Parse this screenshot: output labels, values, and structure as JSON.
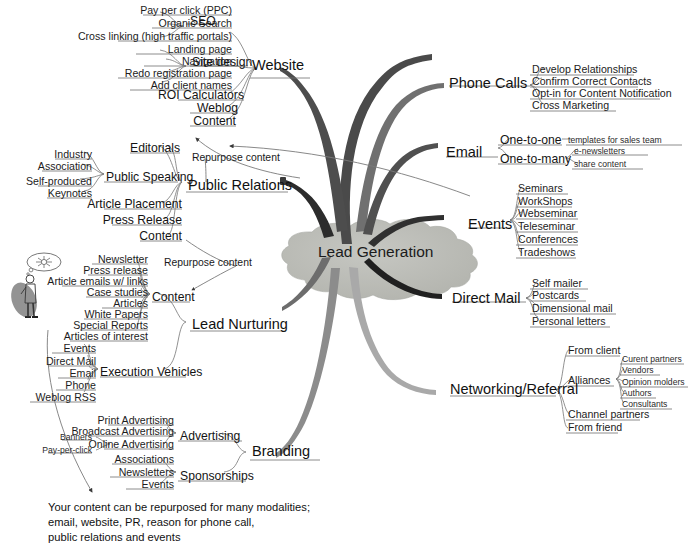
{
  "title": "Lead Generation",
  "center": {
    "label": "Lead Generation",
    "fill": "#b9bab5"
  },
  "colors": {
    "website": "#4a4a4a",
    "public_relations": "#2b2b2b",
    "lead_nurturing": "#6b6b6b",
    "branding": "#8a8a8a",
    "phone_calls": "#6f6f6f",
    "email": "#4e4e4e",
    "events": "#2f2f2f",
    "direct_mail": "#1f1f1f",
    "networking": "#a8a8a8",
    "hairline": "#8d8d8d"
  },
  "branches": [
    {
      "id": "website",
      "label": "Website",
      "side": "left",
      "children": [
        {
          "label": "SEO",
          "children": [
            {
              "label": "Pay per click (PPC)"
            },
            {
              "label": "Organic Search"
            },
            {
              "label": "Cross linking (high traffic portals)"
            }
          ]
        },
        {
          "label": "Site design",
          "children": [
            {
              "label": "Landing page"
            },
            {
              "label": "Navigation"
            },
            {
              "label": "Redo registration page"
            },
            {
              "label": "Add client names"
            }
          ]
        },
        {
          "label": "ROI Calculators"
        },
        {
          "label": "Weblog"
        },
        {
          "label": "Content"
        }
      ]
    },
    {
      "id": "public_relations",
      "label": "Public Relations",
      "side": "left",
      "children": [
        {
          "label": "Public Speaking",
          "children": [
            {
              "label": "Industry"
            },
            {
              "label": "Association"
            },
            {
              "label": "Self-produced"
            },
            {
              "label": "Keynotes"
            }
          ]
        },
        {
          "label": "Editorials"
        },
        {
          "label": "Article Placement"
        },
        {
          "label": "Press Release"
        },
        {
          "label": "Content"
        }
      ]
    },
    {
      "id": "lead_nurturing",
      "label": "Lead Nurturing",
      "side": "left",
      "children": [
        {
          "label": "Content",
          "children": [
            {
              "label": "Newsletter"
            },
            {
              "label": "Press release"
            },
            {
              "label": "Article emails w/ links"
            },
            {
              "label": "Case studies"
            },
            {
              "label": "Articles"
            },
            {
              "label": "White Papers"
            },
            {
              "label": "Special Reports"
            },
            {
              "label": "Articles of interest"
            }
          ]
        },
        {
          "label": "Execution Vehicles",
          "children": [
            {
              "label": "Events"
            },
            {
              "label": "Direct Mail"
            },
            {
              "label": "Email"
            },
            {
              "label": "Phone"
            },
            {
              "label": "Weblog RSS"
            }
          ]
        }
      ]
    },
    {
      "id": "branding",
      "label": "Branding",
      "side": "left",
      "children": [
        {
          "label": "Advertising",
          "children": [
            {
              "label": "Print Advertising"
            },
            {
              "label": "Broadcast Advertising"
            },
            {
              "label": "Online Advertising",
              "children": [
                {
                  "label": "Banners"
                },
                {
                  "label": "Pay-per-click"
                }
              ]
            }
          ]
        },
        {
          "label": "Sponsorships",
          "children": [
            {
              "label": "Associations"
            },
            {
              "label": "Newsletters"
            },
            {
              "label": "Events"
            }
          ]
        }
      ]
    },
    {
      "id": "phone_calls",
      "label": "Phone Calls",
      "side": "right",
      "children": [
        {
          "label": "Develop Relationships"
        },
        {
          "label": "Confirm Correct Contacts"
        },
        {
          "label": "Opt-in for Content Notification"
        },
        {
          "label": "Cross Marketing"
        }
      ]
    },
    {
      "id": "email",
      "label": "Email",
      "side": "right",
      "children": [
        {
          "label": "One-to-one",
          "children": [
            {
              "label": "templates for sales team"
            }
          ]
        },
        {
          "label": "One-to-many",
          "children": [
            {
              "label": "e-newsletters"
            },
            {
              "label": "share content"
            }
          ]
        }
      ]
    },
    {
      "id": "events",
      "label": "Events",
      "side": "right",
      "children": [
        {
          "label": "Seminars"
        },
        {
          "label": "WorkShops"
        },
        {
          "label": "Webseminar"
        },
        {
          "label": "Teleseminar"
        },
        {
          "label": "Conferences"
        },
        {
          "label": "Tradeshows"
        }
      ]
    },
    {
      "id": "direct_mail",
      "label": "Direct Mail",
      "side": "right",
      "children": [
        {
          "label": "Self mailer"
        },
        {
          "label": "Postcards"
        },
        {
          "label": "Dimensional mail"
        },
        {
          "label": "Personal letters"
        }
      ]
    },
    {
      "id": "networking",
      "label": "Networking/Referral",
      "side": "right",
      "children": [
        {
          "label": "From client"
        },
        {
          "label": "Alliances",
          "children": [
            {
              "label": "Curent partners"
            },
            {
              "label": "Vendors"
            },
            {
              "label": "Opinion molders"
            },
            {
              "label": "Authors"
            },
            {
              "label": "Consultants"
            }
          ]
        },
        {
          "label": "Channel partners"
        },
        {
          "label": "From friend"
        }
      ]
    }
  ],
  "annotations": {
    "repurpose_top": "Repurpose content",
    "repurpose_mid": "Repurpose content",
    "footnote_line1": "Your content can be repurposed for many modalities;",
    "footnote_line2": "email, website, PR, reason for phone call,",
    "footnote_line3": "public relations and events"
  },
  "labels": {
    "website": "Website",
    "seo": "SEO",
    "ppc": "Pay per click (PPC)",
    "organic_search": "Organic Search",
    "cross_linking": "Cross linking (high traffic portals)",
    "site_design": "Site design",
    "landing_page": "Landing page",
    "navigation": "Navigation",
    "redo_registration": "Redo registration page",
    "add_client_names": "Add client names",
    "roi_calculators": "ROI Calculators",
    "weblog": "Weblog",
    "website_content": "Content",
    "public_relations": "Public Relations",
    "editorials": "Editorials",
    "public_speaking": "Public Speaking",
    "industry": "Industry",
    "association": "Association",
    "self_produced": "Self-produced",
    "keynotes": "Keynotes",
    "article_placement": "Article Placement",
    "press_release_pr": "Press Release",
    "pr_content": "Content",
    "lead_nurturing": "Lead Nurturing",
    "ln_content": "Content",
    "newsletter": "Newsletter",
    "press_release": "Press release",
    "article_emails": "Article emails w/ links",
    "case_studies": "Case studies",
    "articles": "Articles",
    "white_papers": "White Papers",
    "special_reports": "Special Reports",
    "articles_of_interest": "Articles of interest",
    "execution_vehicles": "Execution Vehicles",
    "ev_events": "Events",
    "ev_direct_mail": "Direct Mail",
    "ev_email": "Email",
    "ev_phone": "Phone",
    "ev_weblog_rss": "Weblog RSS",
    "branding": "Branding",
    "advertising": "Advertising",
    "print_advertising": "Print Advertising",
    "broadcast_advertising": "Broadcast Advertising",
    "online_advertising": "Online Advertising",
    "banners": "Banners",
    "pay_per_click": "Pay-per-click",
    "sponsorships": "Sponsorships",
    "associations": "Associations",
    "newsletters": "Newsletters",
    "br_events": "Events",
    "phone_calls": "Phone Calls",
    "develop_relationships": "Develop Relationships",
    "confirm_contacts": "Confirm Correct Contacts",
    "opt_in": "Opt-in for Content Notification",
    "cross_marketing": "Cross Marketing",
    "email": "Email",
    "one_to_one": "One-to-one",
    "templates_sales": "templates for sales team",
    "one_to_many": "One-to-many",
    "e_newsletters": "e-newsletters",
    "share_content": "share content",
    "events": "Events",
    "seminars": "Seminars",
    "workshops": "WorkShops",
    "webseminar": "Webseminar",
    "teleseminar": "Teleseminar",
    "conferences": "Conferences",
    "tradeshows": "Tradeshows",
    "direct_mail": "Direct Mail",
    "self_mailer": "Self mailer",
    "postcards": "Postcards",
    "dimensional_mail": "Dimensional mail",
    "personal_letters": "Personal letters",
    "networking": "Networking/Referral",
    "from_client": "From client",
    "alliances": "Alliances",
    "curent_partners": "Curent partners",
    "vendors": "Vendors",
    "opinion_molders": "Opinion molders",
    "authors": "Authors",
    "consultants": "Consultants",
    "channel_partners": "Channel partners",
    "from_friend": "From friend"
  }
}
